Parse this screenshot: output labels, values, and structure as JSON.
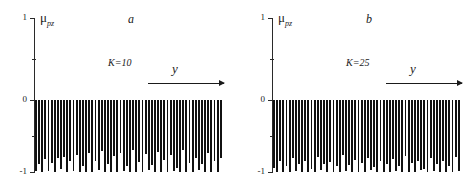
{
  "figure": {
    "type": "two-panel-bar-figure",
    "background": "#ffffff",
    "bar_color": "#111111",
    "axis_color": "#2a2a2a"
  },
  "chart_data": [
    {
      "type": "bar",
      "panel_label": "a",
      "annotation": "K=10",
      "title": "",
      "ylabel": "μ",
      "ylabel_subscript": "pz",
      "xlabel": "y",
      "x_axis_arrow": true,
      "ytick_labels": [
        "1",
        "0",
        "-1"
      ],
      "ytick_values": [
        1,
        0,
        -1
      ],
      "yminor_ticks": [
        0.5,
        -0.5
      ],
      "ylim": [
        -1,
        1
      ],
      "grid": false,
      "legend": null,
      "categories": [
        1,
        2,
        3,
        4,
        5,
        6,
        7,
        8,
        9,
        10,
        11,
        12,
        13,
        14,
        15,
        16,
        17,
        18,
        19,
        20,
        21,
        22,
        23,
        24,
        25,
        26,
        27,
        28,
        29,
        30,
        31,
        32,
        33,
        34,
        35,
        36,
        37,
        38,
        39,
        40,
        41,
        42,
        43,
        44,
        45,
        46,
        47,
        48,
        49,
        50,
        51,
        52,
        53,
        54,
        55,
        56,
        57,
        58,
        59,
        60
      ],
      "values": [
        -0.97,
        -0.88,
        -0.99,
        -0.81,
        -0.97,
        -0.86,
        -0.99,
        -0.8,
        -0.95,
        -0.78,
        -0.99,
        -0.83,
        -0.97,
        -0.75,
        -0.99,
        -0.9,
        -0.98,
        -0.73,
        -0.99,
        -0.84,
        -0.96,
        -0.7,
        -0.99,
        -0.87,
        -0.98,
        -0.77,
        -0.99,
        -0.72,
        -0.97,
        -0.91,
        -0.99,
        -0.68,
        -0.98,
        -0.85,
        -0.99,
        -0.74,
        -0.96,
        -0.89,
        -0.99,
        -0.71,
        -0.98,
        -0.82,
        -0.99,
        -0.76,
        -0.97,
        -0.93,
        -0.99,
        -0.69,
        -0.98,
        -0.86,
        -0.99,
        -0.79,
        -0.96,
        -0.88,
        -0.99,
        -0.73,
        -0.98,
        -0.84,
        -0.99,
        -0.8
      ]
    },
    {
      "type": "bar",
      "panel_label": "b",
      "annotation": "K=25",
      "title": "",
      "ylabel": "μ",
      "ylabel_subscript": "pz",
      "xlabel": "y",
      "x_axis_arrow": true,
      "ytick_labels": [
        "1",
        "0",
        "-1"
      ],
      "ytick_values": [
        1,
        0,
        -1
      ],
      "yminor_ticks": [
        0.5,
        -0.5
      ],
      "ylim": [
        -1,
        1
      ],
      "grid": false,
      "legend": null,
      "categories": [
        1,
        2,
        3,
        4,
        5,
        6,
        7,
        8,
        9,
        10,
        11,
        12,
        13,
        14,
        15,
        16,
        17,
        18,
        19,
        20,
        21,
        22,
        23,
        24,
        25,
        26,
        27,
        28,
        29,
        30,
        31,
        32,
        33,
        34,
        35,
        36,
        37,
        38,
        39,
        40,
        41,
        42,
        43,
        44,
        45,
        46,
        47,
        48,
        49,
        50,
        51,
        52,
        53,
        54,
        55,
        56,
        57,
        58,
        59,
        60
      ],
      "values": [
        -0.93,
        -0.99,
        -0.84,
        -0.98,
        -0.9,
        -0.99,
        -0.8,
        -0.97,
        -0.88,
        -0.99,
        -0.83,
        -0.98,
        -0.94,
        -0.99,
        -0.78,
        -0.96,
        -0.87,
        -0.99,
        -0.85,
        -0.98,
        -0.91,
        -0.99,
        -0.76,
        -0.97,
        -0.89,
        -0.99,
        -0.82,
        -0.98,
        -0.86,
        -0.99,
        -0.79,
        -0.96,
        -0.92,
        -0.99,
        -0.84,
        -0.98,
        -0.88,
        -0.99,
        -0.81,
        -0.97,
        -0.9,
        -0.99,
        -0.77,
        -0.98,
        -0.86,
        -0.99,
        -0.83,
        -0.96,
        -0.95,
        -0.99,
        -0.8,
        -0.97,
        -0.87,
        -0.99,
        -0.84,
        -0.98,
        -0.91,
        -0.99,
        -0.78,
        -0.97
      ]
    }
  ],
  "panels": [
    {
      "name": "panel-a",
      "letter": "a",
      "annotation": "K=10",
      "ylabel_main": "μ",
      "ylabel_sub": "pz",
      "xlabel": "y",
      "ticks": {
        "top": "1",
        "zero": "0",
        "bottom": "-1"
      }
    },
    {
      "name": "panel-b",
      "letter": "b",
      "annotation": "K=25",
      "ylabel_main": "μ",
      "ylabel_sub": "pz",
      "xlabel": "y",
      "ticks": {
        "top": "1",
        "zero": "0",
        "bottom": "-1"
      }
    }
  ]
}
